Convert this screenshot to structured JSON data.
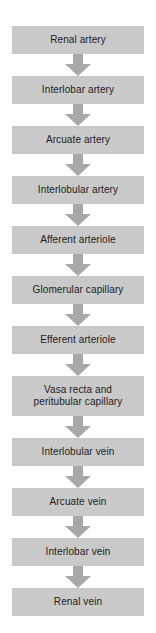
{
  "diagram": {
    "orientation": "vertical-top-to-bottom",
    "background_color": "#ffffff",
    "node_fill_color": "#c9c9c9",
    "node_text_color": "#1c1c1c",
    "arrow_color": "#a8a8a8",
    "arrow_icon": "arrow-down-block-icon",
    "nodes": [
      {
        "label": "Renal artery",
        "lines": 1
      },
      {
        "label": "Interlobar artery",
        "lines": 1
      },
      {
        "label": "Arcuate artery",
        "lines": 1
      },
      {
        "label": "Interlobular artery",
        "lines": 1
      },
      {
        "label": "Afferent arteriole",
        "lines": 1
      },
      {
        "label": "Glomerular capillary",
        "lines": 1
      },
      {
        "label": "Efferent arteriole",
        "lines": 1
      },
      {
        "label": "Vasa recta and\nperitubular capillary",
        "lines": 2
      },
      {
        "label": "Interlobular vein",
        "lines": 1
      },
      {
        "label": "Arcuate vein",
        "lines": 1
      },
      {
        "label": "Interlobar vein",
        "lines": 1
      },
      {
        "label": "Renal vein",
        "lines": 1
      }
    ]
  }
}
